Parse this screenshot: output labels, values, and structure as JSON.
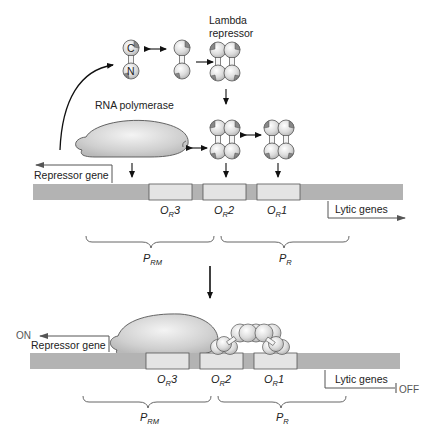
{
  "colors": {
    "dna": "#b3b3b3",
    "operator_box": "#e4e4e4",
    "protein_fill": "#d9d9d9",
    "outline": "#555555",
    "arrow": "#111111"
  },
  "top_panel": {
    "lambda_repressor_label_line1": "Lambda",
    "lambda_repressor_label_line2": "repressor",
    "monomer_domain_c": "C",
    "monomer_domain_n": "N",
    "rna_polymerase_label": "RNA polymerase",
    "repressor_gene_label": "Repressor gene",
    "lytic_genes_label": "Lytic genes",
    "operators": [
      {
        "name": "O",
        "sub": "R",
        "num": "3"
      },
      {
        "name": "O",
        "sub": "R",
        "num": "2"
      },
      {
        "name": "O",
        "sub": "R",
        "num": "1"
      }
    ],
    "promoters": [
      {
        "name": "P",
        "sub": "RM"
      },
      {
        "name": "P",
        "sub": "R"
      }
    ]
  },
  "bottom_panel": {
    "repressor_gene_label": "Repressor gene",
    "repressor_state": "ON",
    "lytic_genes_label": "Lytic genes",
    "lytic_state": "OFF",
    "operators": [
      {
        "name": "O",
        "sub": "R",
        "num": "3"
      },
      {
        "name": "O",
        "sub": "R",
        "num": "2"
      },
      {
        "name": "O",
        "sub": "R",
        "num": "1"
      }
    ],
    "promoters": [
      {
        "name": "P",
        "sub": "RM"
      },
      {
        "name": "P",
        "sub": "R"
      }
    ]
  }
}
